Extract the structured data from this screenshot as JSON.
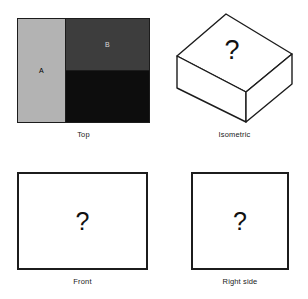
{
  "figure": {
    "kind": "orthographic-projection-exercise",
    "background_color": "#ffffff",
    "line_color": "#1c1c1c",
    "unknown_glyph": "?"
  },
  "views": {
    "top": {
      "caption": "Top",
      "regions": [
        {
          "id": "a",
          "label": "A",
          "fill": "#b3b3b3",
          "label_color": "#000000"
        },
        {
          "id": "b",
          "label": "B",
          "fill": "#3d3d3d",
          "label_color": "#d8d8d8"
        },
        {
          "id": "c",
          "label": "",
          "fill": "#0d0d0d",
          "label_color": "#ffffff"
        }
      ]
    },
    "isometric": {
      "caption": "Isometric",
      "face_label": "?",
      "fill": "#ffffff",
      "stroke": "#1c1c1c"
    },
    "front": {
      "caption": "Front",
      "content": "?",
      "fill": "#ffffff",
      "stroke": "#1c1c1c"
    },
    "right_side": {
      "caption": "Right side",
      "content": "?",
      "fill": "#ffffff",
      "stroke": "#1c1c1c"
    }
  }
}
